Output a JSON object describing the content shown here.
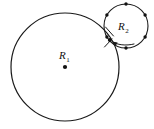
{
  "figure": {
    "background_color": "#ffffff",
    "stroke_color": "#1a1a1a",
    "dot_color": "#111111",
    "width": 154,
    "height": 129,
    "large_circle": {
      "name": "large-circle",
      "label_text": "R",
      "label_subscript": "1",
      "center_x": 65,
      "center_y": 67,
      "radius": 54,
      "stroke_width": 1.2,
      "center_dot_radius": 2.1,
      "label_x": 59,
      "label_y": 59,
      "has_center_dot": true
    },
    "small_circle": {
      "name": "small-circle",
      "label_text": "R",
      "label_subscript": "2",
      "center_x": 126,
      "center_y": 26,
      "radius": 22,
      "stroke_width": 1.1,
      "label_x": 118,
      "label_y": 26,
      "dot_radius": 1.7,
      "dot_count": 6,
      "dot_angles_deg": [
        90,
        30,
        330,
        270,
        210,
        150
      ],
      "dots": [
        {
          "name": "small-circle-dot-top",
          "x": 126.0,
          "y": 4.0
        },
        {
          "name": "small-circle-dot-upper-right",
          "x": 145.1,
          "y": 15.0
        },
        {
          "name": "small-circle-dot-lower-right",
          "x": 145.1,
          "y": 37.0
        },
        {
          "name": "small-circle-dot-bottom",
          "x": 126.0,
          "y": 48.0
        },
        {
          "name": "small-circle-dot-lower-left",
          "x": 106.9,
          "y": 37.0
        },
        {
          "name": "small-circle-dot-upper-left",
          "x": 106.9,
          "y": 15.0
        }
      ]
    },
    "tangent_point": {
      "name": "tangency-point",
      "x": 109.8,
      "y": 40.1,
      "dot_radius": 2.0
    },
    "pointer_arrow": {
      "name": "tangency-pointer-arrow",
      "path": "M 134 44 C 126 46, 117 45, 112 41.5",
      "head_points": "112,41.5 117.6,42.4 115.8,45.8"
    },
    "tick_marks": [
      {
        "name": "tangency-tick-upper",
        "x1": 105.5,
        "y1": 27.0,
        "x2": 113.5,
        "y2": 36.0
      },
      {
        "name": "tangency-tick-lower",
        "x1": 104.5,
        "y1": 47.0,
        "x2": 112.0,
        "y2": 39.0
      }
    ]
  }
}
